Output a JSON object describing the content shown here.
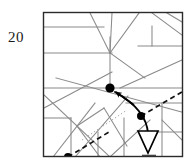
{
  "figure": {
    "label": "20",
    "caption_number": "20",
    "type": "line-arrangement-diagram",
    "colors": {
      "frame": "#2b2b2b",
      "line": "#8a8a8a",
      "line_dark": "#6e6e6e",
      "dot": "#000000",
      "arrow": "#000000",
      "dashed": "#111111",
      "triangle_fill": "#ffffff",
      "triangle_stroke": "#000000",
      "background": "#ffffff",
      "label_text": "#1a1a1a"
    },
    "frame": {
      "x": 43,
      "y": 12,
      "width": 140,
      "height": 145,
      "stroke_width": 1.4
    },
    "lines": [
      {
        "name": "h-upper-left",
        "x1": 44,
        "y1": 27,
        "x2": 104,
        "y2": 27
      },
      {
        "name": "h-mid-left",
        "x1": 44,
        "y1": 53,
        "x2": 112,
        "y2": 53
      },
      {
        "name": "h-long-center",
        "x1": 44,
        "y1": 88,
        "x2": 182,
        "y2": 88
      },
      {
        "name": "h-short-lower-left",
        "x1": 44,
        "y1": 118,
        "x2": 71,
        "y2": 118
      },
      {
        "name": "h-right-upper",
        "x1": 138,
        "y1": 46,
        "x2": 182,
        "y2": 46
      },
      {
        "name": "h-right-mid",
        "x1": 126,
        "y1": 103,
        "x2": 182,
        "y2": 103
      },
      {
        "name": "h-right-lower",
        "x1": 141,
        "y1": 132,
        "x2": 182,
        "y2": 132
      },
      {
        "name": "v-center-upper",
        "x1": 110,
        "y1": 37,
        "x2": 110,
        "y2": 88
      },
      {
        "name": "v-right-upper",
        "x1": 152,
        "y1": 26,
        "x2": 152,
        "y2": 46
      },
      {
        "name": "v-right-lower",
        "x1": 162,
        "y1": 103,
        "x2": 162,
        "y2": 157
      },
      {
        "name": "v-left-lower",
        "x1": 71,
        "y1": 118,
        "x2": 71,
        "y2": 157
      },
      {
        "name": "v-mid-lower",
        "x1": 98,
        "y1": 132,
        "x2": 98,
        "y2": 157
      },
      {
        "name": "v-mid-lower2",
        "x1": 124,
        "y1": 118,
        "x2": 124,
        "y2": 157
      },
      {
        "name": "diag-fan-a",
        "x1": 110,
        "y1": 53,
        "x2": 90,
        "y2": 13
      },
      {
        "name": "diag-fan-b",
        "x1": 110,
        "y1": 53,
        "x2": 112,
        "y2": 13
      },
      {
        "name": "diag-fan-c",
        "x1": 110,
        "y1": 53,
        "x2": 139,
        "y2": 13
      },
      {
        "name": "diag-fan-d",
        "x1": 110,
        "y1": 53,
        "x2": 145,
        "y2": 78
      },
      {
        "name": "diag-upper-right",
        "x1": 152,
        "y1": 13,
        "x2": 182,
        "y2": 35
      },
      {
        "name": "diag-right-slope",
        "x1": 120,
        "y1": 88,
        "x2": 182,
        "y2": 60
      },
      {
        "name": "diag-long-down-right",
        "x1": 56,
        "y1": 78,
        "x2": 182,
        "y2": 112
      },
      {
        "name": "diag-left-up",
        "x1": 44,
        "y1": 108,
        "x2": 112,
        "y2": 72
      },
      {
        "name": "diag-left-down",
        "x1": 44,
        "y1": 95,
        "x2": 110,
        "y2": 157
      },
      {
        "name": "diag-left-steep",
        "x1": 53,
        "y1": 157,
        "x2": 95,
        "y2": 103
      },
      {
        "name": "diag-center-cross",
        "x1": 75,
        "y1": 157,
        "x2": 128,
        "y2": 96
      },
      {
        "name": "diag-box-left",
        "x1": 77,
        "y1": 126,
        "x2": 104,
        "y2": 108
      },
      {
        "name": "diag-box-down",
        "x1": 104,
        "y1": 108,
        "x2": 127,
        "y2": 146
      },
      {
        "name": "diag-box-bottom",
        "x1": 77,
        "y1": 126,
        "x2": 100,
        "y2": 157
      },
      {
        "name": "diag-lower-right-up",
        "x1": 110,
        "y1": 157,
        "x2": 150,
        "y2": 120
      },
      {
        "name": "diag-far-right",
        "x1": 162,
        "y1": 120,
        "x2": 182,
        "y2": 140
      },
      {
        "name": "diag-near-top-right",
        "x1": 167,
        "y1": 13,
        "x2": 182,
        "y2": 22
      }
    ],
    "dotted_lines": [
      {
        "name": "dotted-diagonal",
        "x1": 82,
        "y1": 140,
        "x2": 127,
        "y2": 110
      }
    ],
    "dashed_lines": [
      {
        "name": "dashed-upper-right",
        "x1": 141,
        "y1": 116,
        "x2": 190,
        "y2": 88
      },
      {
        "name": "dashed-lower-left",
        "x1": 68,
        "y1": 157,
        "x2": 108,
        "y2": 133
      }
    ],
    "points": [
      {
        "name": "vertex-main",
        "x": 110,
        "y": 88,
        "r": 4.6,
        "label": ""
      },
      {
        "name": "vertex-secondary",
        "x": 141,
        "y": 116,
        "r": 4.0,
        "label": ""
      },
      {
        "name": "vertex-bottom",
        "x": 68,
        "y": 157,
        "r": 4.0,
        "label": ""
      }
    ],
    "arrows": [
      {
        "name": "straight-arrow-to-vertex",
        "from_x": 132,
        "from_y": 104,
        "to_x": 114,
        "to_y": 91,
        "head": "solid"
      }
    ],
    "curves": [
      {
        "name": "curved-arrow-to-triangle",
        "start_x": 114,
        "start_y": 92,
        "ctrl_x": 146,
        "ctrl_y": 112,
        "end_x": 148,
        "end_y": 136,
        "head": "hollow-triangle"
      }
    ],
    "triangle_marker": {
      "name": "hollow-triangle-pointer",
      "apex_x": 148,
      "apex_y": 152,
      "left_x": 138,
      "left_y": 131,
      "right_x": 158,
      "right_y": 131
    },
    "bottom_tick": {
      "name": "bottom-edge-tick",
      "x1": 142,
      "x2": 156,
      "y": 157
    }
  }
}
